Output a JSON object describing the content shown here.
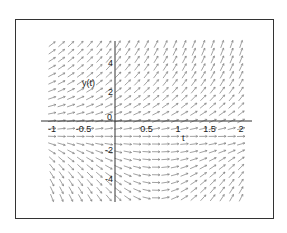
{
  "chart_data": {
    "type": "direction_field",
    "title": "",
    "xlabel": "t",
    "ylabel": "y(t)",
    "xlim": [
      -1.1,
      2.1
    ],
    "ylim": [
      -5.5,
      5.5
    ],
    "x_ticks": [
      -1,
      -0.5,
      0,
      0.5,
      1,
      1.5,
      2
    ],
    "x_tick_labels": [
      "-1",
      "-0.5",
      "0",
      "0.5",
      "1",
      "1.5",
      "2"
    ],
    "y_ticks": [
      -4,
      -2,
      2,
      4
    ],
    "y_tick_labels": [
      "-4",
      "-2",
      "2",
      "4"
    ],
    "grid": false,
    "legend": null,
    "field_description": "Slope field: steep positive slopes for y>0 (increasing with t); near-horizontal slopes around y≈-1 for t<0.5; for y<-1 slopes negative at t<~0.8 and turning positive for t>~1, producing curved (U-shaped) flow in the lower right.",
    "arrow_color": "#7a7a7a",
    "axis_color": "#333333"
  },
  "axes": {
    "x_label": "t",
    "y_label": "y(t)",
    "origin_label": "0"
  }
}
